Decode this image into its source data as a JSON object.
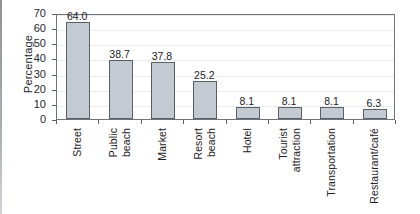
{
  "chart_data": {
    "type": "bar",
    "title": "",
    "xlabel": "",
    "ylabel": "Percentage",
    "ylim": [
      0,
      70
    ],
    "yticks": [
      0,
      10,
      20,
      30,
      40,
      50,
      60,
      70
    ],
    "grid": true,
    "legend": "none",
    "categories": [
      "Street",
      "Public beach",
      "Market",
      "Resort beach",
      "Hotel",
      "Tourist attraction",
      "Transportation",
      "Restaurant/café"
    ],
    "category_lines": [
      [
        "Street"
      ],
      [
        "Public",
        "beach"
      ],
      [
        "Market"
      ],
      [
        "Resort",
        "beach"
      ],
      [
        "Hotel"
      ],
      [
        "Tourist",
        "attraction"
      ],
      [
        "Transportation"
      ],
      [
        "Restaurant/café"
      ]
    ],
    "values": [
      64.0,
      38.7,
      37.8,
      25.2,
      8.1,
      8.1,
      8.1,
      6.3
    ],
    "value_labels": [
      "64.0",
      "38.7",
      "37.8",
      "25.2",
      "8.1",
      "8.1",
      "8.1",
      "6.3"
    ],
    "colors": {
      "bar_fill": "#c4cad2",
      "bar_stroke": "#5a5f66",
      "axis": "#6f737a",
      "grid": "#e9ecef",
      "text": "#1f2226",
      "background": "#ffffff"
    }
  }
}
